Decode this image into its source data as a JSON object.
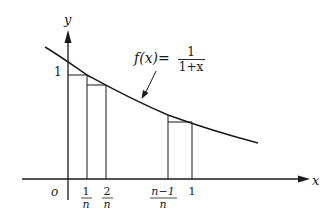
{
  "diagram": {
    "function_label": {
      "lhs": "f(x)=",
      "numerator": "1",
      "denominator": "1+x"
    },
    "axes": {
      "x_label": "x",
      "y_label": "y",
      "origin_label": "o",
      "y_tick_label": "1"
    },
    "x_ticks": [
      {
        "numerator": "1",
        "denominator": "n"
      },
      {
        "numerator": "2",
        "denominator": "n"
      },
      {
        "numerator": "n−1",
        "denominator": "n"
      },
      {
        "label": "1"
      }
    ],
    "colors": {
      "stroke": "#1a1a1a",
      "background": "#ffffff"
    }
  }
}
